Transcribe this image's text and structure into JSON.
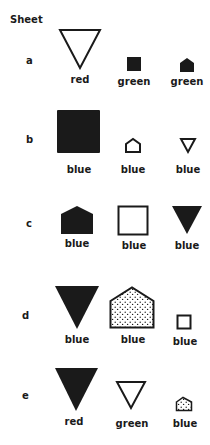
{
  "sheet": {
    "title": "Sheet",
    "rows": [
      {
        "label": "a",
        "items": [
          {
            "shape": "triangle-down",
            "fill": "outline",
            "size": "large",
            "caption": "red"
          },
          {
            "shape": "square",
            "fill": "solid",
            "size": "small",
            "caption": "green"
          },
          {
            "shape": "pentagon-house",
            "fill": "solid",
            "size": "small",
            "caption": "green"
          }
        ]
      },
      {
        "label": "b",
        "items": [
          {
            "shape": "square",
            "fill": "solid",
            "size": "large",
            "caption": "blue"
          },
          {
            "shape": "pentagon-house",
            "fill": "outline",
            "size": "small",
            "caption": "blue"
          },
          {
            "shape": "triangle-down",
            "fill": "outline",
            "size": "small",
            "caption": "blue"
          }
        ]
      },
      {
        "label": "c",
        "items": [
          {
            "shape": "pentagon-house",
            "fill": "solid",
            "size": "medium",
            "caption": "blue"
          },
          {
            "shape": "square",
            "fill": "outline",
            "size": "medium",
            "caption": "blue"
          },
          {
            "shape": "triangle-down",
            "fill": "solid",
            "size": "medium",
            "caption": "blue"
          }
        ]
      },
      {
        "label": "d",
        "items": [
          {
            "shape": "triangle-down",
            "fill": "solid",
            "size": "large",
            "caption": "blue"
          },
          {
            "shape": "pentagon-house",
            "fill": "dotted",
            "size": "large",
            "caption": "blue"
          },
          {
            "shape": "square",
            "fill": "outline",
            "size": "small",
            "caption": "blue"
          }
        ]
      },
      {
        "label": "e",
        "items": [
          {
            "shape": "triangle-down",
            "fill": "solid",
            "size": "large",
            "caption": "red"
          },
          {
            "shape": "triangle-down",
            "fill": "outline",
            "size": "medium",
            "caption": "green"
          },
          {
            "shape": "pentagon-house",
            "fill": "dotted",
            "size": "small",
            "caption": "blue"
          }
        ]
      }
    ]
  }
}
